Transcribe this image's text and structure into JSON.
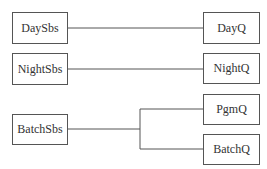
{
  "diagram": {
    "nodes": {
      "day_sbs": "DaySbs",
      "night_sbs": "NightSbs",
      "batch_sbs": "BatchSbs",
      "day_q": "DayQ",
      "night_q": "NightQ",
      "pgm_q": "PgmQ",
      "batch_q": "BatchQ"
    },
    "edges": [
      {
        "from": "DaySbs",
        "to": "DayQ"
      },
      {
        "from": "NightSbs",
        "to": "NightQ"
      },
      {
        "from": "BatchSbs",
        "to": "PgmQ"
      },
      {
        "from": "BatchSbs",
        "to": "BatchQ"
      }
    ],
    "colors": {
      "line": "#555555",
      "text": "#333333",
      "background": "#ffffff"
    }
  }
}
